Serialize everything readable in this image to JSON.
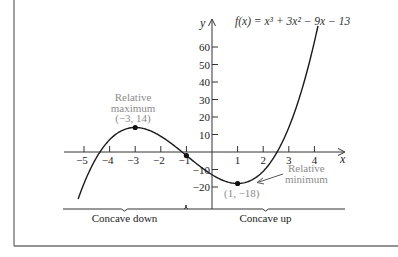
{
  "chart_data": {
    "type": "line",
    "title": "f(x) = x³ + 3x² − 9x − 13",
    "function": {
      "expression": "x^3 + 3x^2 - 9x - 13",
      "coefficients_high_to_low": [
        1,
        3,
        -9,
        -13
      ]
    },
    "xlabel": "x",
    "ylabel": "y",
    "xlim": [
      -5.3,
      4.9
    ],
    "ylim": [
      -27,
      73
    ],
    "curve_x_range": [
      -5.23,
      4.14
    ],
    "x_ticks": [
      {
        "value": -5,
        "label": "−5"
      },
      {
        "value": -4,
        "label": "−4"
      },
      {
        "value": -3,
        "label": "−3"
      },
      {
        "value": -2,
        "label": "−2"
      },
      {
        "value": -1,
        "label": "−1"
      },
      {
        "value": 1,
        "label": "1"
      },
      {
        "value": 2,
        "label": "2"
      },
      {
        "value": 3,
        "label": "3"
      },
      {
        "value": 4,
        "label": "4"
      }
    ],
    "y_ticks": [
      {
        "value": 60,
        "label": "60"
      },
      {
        "value": 50,
        "label": "50"
      },
      {
        "value": 40,
        "label": "40"
      },
      {
        "value": 30,
        "label": "30"
      },
      {
        "value": 20,
        "label": "20"
      },
      {
        "value": 10,
        "label": "10"
      },
      {
        "value": -10,
        "label": "−10"
      },
      {
        "value": -20,
        "label": "−20"
      }
    ],
    "grid": false,
    "legend": "none",
    "points": [
      {
        "name": "relative-maximum",
        "x": -3,
        "y": 14
      },
      {
        "name": "inflection-point",
        "x": -1,
        "y": -2
      },
      {
        "name": "relative-minimum",
        "x": 1,
        "y": -18
      }
    ],
    "annotations": {
      "max_line1": "Relative",
      "max_line2": "maximum",
      "max_coords": "(−3, 14)",
      "min_line1": "Relative",
      "min_line2": "minimum",
      "min_coords": "(1, −18)"
    },
    "concavity": [
      {
        "label": "Concave down",
        "x_from": -5.8,
        "x_to": -1
      },
      {
        "label": "Concave up",
        "x_from": -1,
        "x_to": 5.2
      }
    ],
    "colors": {
      "curve": "#1a1a1a",
      "axes": "#333333",
      "annotation_text": "#8c8c8c",
      "frame": "#6e6e6e"
    }
  }
}
